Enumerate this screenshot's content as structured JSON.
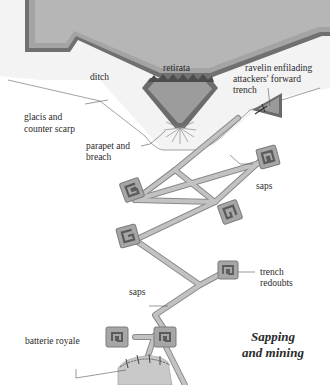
{
  "diagram": {
    "title_line1": "Sapping",
    "title_line2": "and mining",
    "labels": {
      "retirata": "retirata",
      "ditch": "ditch",
      "ravelin_line1": "ravelin enfilading",
      "ravelin_line2": "attackers' forward",
      "ravelin_line3": "trench",
      "glacis_line1": "glacis and",
      "glacis_line2": "counter scarp",
      "parapet_line1": "parapet and",
      "parapet_line2": "breach",
      "saps_upper": "saps",
      "saps_lower": "saps",
      "trench_redoubts_line1": "trench",
      "trench_redoubts_line2": "redoubts",
      "batterie_royale": "batterie royale"
    },
    "colors": {
      "fortress_fill": "#b4b4b4",
      "fortress_inner": "#bdbdbd",
      "wall_dark": "#6e6e6e",
      "wall_light": "#a0a0a0",
      "ditch_bg": "#f4f4f4",
      "trench_fill": "#b8b8b8",
      "trench_edge": "#8a8a8a",
      "redoubt_outer": "#9a9a9a",
      "redoubt_inner": "#6a6a6a",
      "label_text": "#2a2a2a"
    }
  }
}
